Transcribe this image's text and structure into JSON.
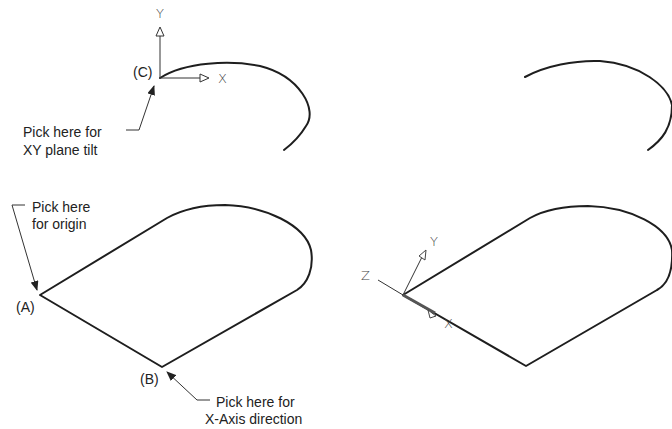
{
  "panels": {
    "top_left": {
      "point_label": "(C)",
      "axis_x": "X",
      "axis_y": "Y",
      "callout": [
        "Pick here for",
        "XY plane tilt"
      ]
    },
    "top_right": {},
    "bottom_left": {
      "origin_label": "(A)",
      "x_point_label": "(B)",
      "callout_origin": [
        "Pick here",
        "for origin"
      ],
      "callout_x_axis": [
        "Pick here for",
        "X-Axis direction"
      ]
    },
    "bottom_right": {
      "axis_x": "X",
      "axis_y": "Y",
      "axis_z": "Z"
    }
  },
  "colors": {
    "line": "#1e1e1e",
    "text": "#222222",
    "background": "#ffffff"
  }
}
